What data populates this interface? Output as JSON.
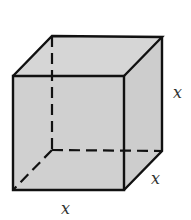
{
  "figure": {
    "type": "cube",
    "labels": {
      "height": "x",
      "depth": "x",
      "width": "x"
    },
    "colors": {
      "fill": "#cdcdcd",
      "stroke": "#111111",
      "label": "#333333"
    }
  }
}
